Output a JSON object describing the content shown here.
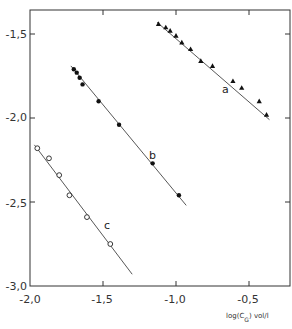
{
  "chart_data": {
    "type": "scatter",
    "title": "",
    "xlabel": "log(C_G) vol/l",
    "ylabel": "",
    "xlim": [
      -2.0,
      -0.25
    ],
    "ylim": [
      -3.0,
      -1.35
    ],
    "grid": false,
    "x_ticks": [
      -2.0,
      -1.5,
      -1.0,
      -0.5
    ],
    "x_tick_labels": [
      "-2,0",
      "-1,5",
      "-1,0",
      "-0,5"
    ],
    "y_ticks": [
      -1.5,
      -2.0,
      -2.5,
      -3.0
    ],
    "y_tick_labels": [
      "-1,5",
      "-2,0",
      "-2,5",
      "-3,0"
    ],
    "legend": "inline labels",
    "series": [
      {
        "name": "a",
        "marker": "filled-triangle",
        "points": [
          [
            -1.12,
            -1.44
          ],
          [
            -1.07,
            -1.46
          ],
          [
            -1.04,
            -1.48
          ],
          [
            -1.0,
            -1.51
          ],
          [
            -0.96,
            -1.55
          ],
          [
            -0.9,
            -1.59
          ],
          [
            -0.83,
            -1.66
          ],
          [
            -0.75,
            -1.69
          ],
          [
            -0.61,
            -1.78
          ],
          [
            -0.55,
            -1.82
          ],
          [
            -0.43,
            -1.9
          ],
          [
            -0.38,
            -1.98
          ]
        ],
        "fit_line": [
          [
            -1.13,
            -1.43
          ],
          [
            -0.36,
            -2.01
          ]
        ]
      },
      {
        "name": "b",
        "marker": "filled-circle",
        "points": [
          [
            -1.7,
            -1.71
          ],
          [
            -1.68,
            -1.73
          ],
          [
            -1.66,
            -1.76
          ],
          [
            -1.64,
            -1.8
          ],
          [
            -1.53,
            -1.9
          ],
          [
            -1.39,
            -2.04
          ],
          [
            -1.16,
            -2.27
          ],
          [
            -0.98,
            -2.46
          ]
        ],
        "fit_line": [
          [
            -1.72,
            -1.69
          ],
          [
            -0.93,
            -2.52
          ]
        ]
      },
      {
        "name": "c",
        "marker": "open-circle",
        "points": [
          [
            -1.95,
            -2.18
          ],
          [
            -1.87,
            -2.24
          ],
          [
            -1.8,
            -2.34
          ],
          [
            -1.73,
            -2.46
          ],
          [
            -1.61,
            -2.59
          ],
          [
            -1.45,
            -2.75
          ]
        ],
        "fit_line": [
          [
            -1.97,
            -2.16
          ],
          [
            -1.3,
            -2.93
          ]
        ]
      }
    ],
    "annotations": [
      {
        "text": "a",
        "x": -0.64,
        "y": -1.71
      },
      {
        "text": "b",
        "x": -1.15,
        "y": -2.19
      },
      {
        "text": "c",
        "x": -1.53,
        "y": -2.74
      }
    ]
  },
  "axes": {
    "x_title_main": "log(C",
    "x_title_sub": "G",
    "x_title_rest": ") vol/l",
    "labels": {
      "a": "a",
      "b": "b",
      "c": "c"
    },
    "x_tick_labels": [
      "-2,0",
      "-1,5",
      "-1,0",
      "-0,5"
    ],
    "y_tick_labels": [
      "-1,5",
      "-2,0",
      "-2,5",
      "-3,0"
    ]
  }
}
